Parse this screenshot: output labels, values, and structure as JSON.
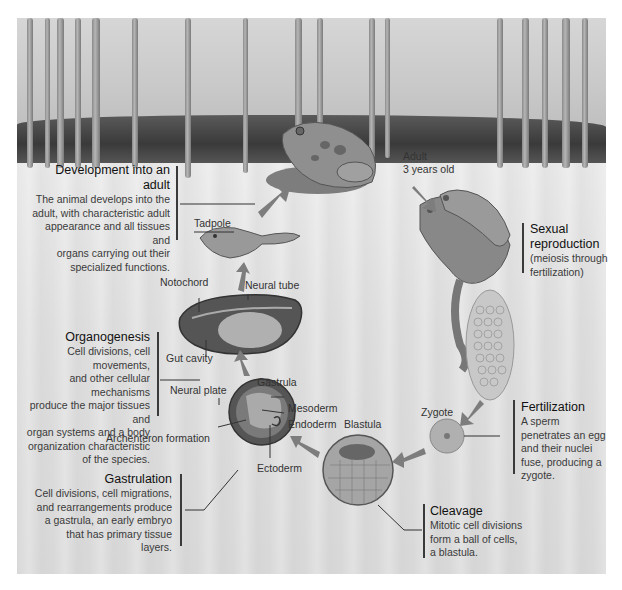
{
  "diagram": {
    "type": "life-cycle"
  },
  "stages": {
    "adult": {
      "label": "Adult",
      "sublabel": "3 years old"
    },
    "tadpole": {
      "label": "Tadpole"
    },
    "zygote": {
      "label": "Zygote"
    },
    "blastula": {
      "label": "Blastula"
    },
    "gastrula": {
      "label": "Gastrula"
    }
  },
  "structure_labels": {
    "notochord": "Notochord",
    "neural_tube": "Neural tube",
    "gut_cavity": "Gut cavity",
    "neural_plate": "Neural plate",
    "mesoderm": "Mesoderm",
    "endoderm": "Endoderm",
    "ectoderm": "Ectoderm",
    "archenteron": "Archenteron formation"
  },
  "processes": {
    "development": {
      "title": "Development into an adult",
      "lines": [
        "The animal develops into the",
        "adult, with characteristic adult",
        "appearance and all tissues and",
        "organs carrying out their",
        "specialized functions."
      ]
    },
    "sexual_reproduction": {
      "title_lines": [
        "Sexual",
        "reproduction"
      ],
      "lines": [
        "(meiosis through",
        "fertilization)"
      ]
    },
    "organogenesis": {
      "title": "Organogenesis",
      "lines": [
        "Cell divisions, cell movements,",
        "and other cellular mechanisms",
        "produce the major tissues and",
        "organ systems and a body",
        "organization characteristic",
        "of the species."
      ]
    },
    "fertilization": {
      "title": "Fertilization",
      "lines": [
        "A sperm",
        "penetrates an egg",
        "and their nuclei",
        "fuse, producing a",
        "zygote."
      ]
    },
    "gastrulation": {
      "title": "Gastrulation",
      "lines": [
        "Cell divisions, cell migrations,",
        "and rearrangements produce",
        "a gastrula, an early embryo",
        "that has primary tissue",
        "layers."
      ]
    },
    "cleavage": {
      "title": "Cleavage",
      "lines": [
        "Mitotic cell divisions",
        "form a ball of cells,",
        "a blastula."
      ]
    }
  },
  "colors": {
    "background": "#ffffff",
    "panel": "#dcdcdc",
    "bank": "#3a3a3a",
    "arrow": "#7a7a7a",
    "text": "#333333"
  }
}
